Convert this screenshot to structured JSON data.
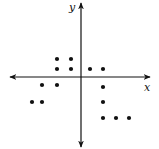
{
  "diagram": {
    "type": "scatter",
    "axes": {
      "x_label": "x",
      "y_label": "y",
      "origin_px": [
        81,
        77
      ],
      "x_axis_px": [
        10,
        150
      ],
      "y_axis_px": [
        3,
        147
      ]
    },
    "colors": {
      "axis": "#111111",
      "point": "#111111",
      "background": "#ffffff"
    },
    "points_px": [
      [
        57,
        59
      ],
      [
        71,
        59
      ],
      [
        57,
        69
      ],
      [
        71,
        69
      ],
      [
        90,
        69
      ],
      [
        103,
        69
      ],
      [
        42,
        85
      ],
      [
        57,
        85
      ],
      [
        103,
        87
      ],
      [
        32,
        102
      ],
      [
        42,
        102
      ],
      [
        103,
        102
      ],
      [
        103,
        118
      ],
      [
        116,
        118
      ],
      [
        129,
        118
      ]
    ]
  },
  "chart_data": {
    "type": "scatter",
    "title": "",
    "xlabel": "x",
    "ylabel": "y",
    "grid": false,
    "legend": null,
    "tick_labels": false,
    "series": [
      {
        "name": "points",
        "points_approx_units": [
          [
            -2,
            1.5
          ],
          [
            -1,
            1.5
          ],
          [
            -2,
            0.75
          ],
          [
            -1,
            0.75
          ],
          [
            0.7,
            0.75
          ],
          [
            1.6,
            0.75
          ],
          [
            -3,
            -0.6
          ],
          [
            -2,
            -0.6
          ],
          [
            1.6,
            -0.8
          ],
          [
            -3.5,
            -2
          ],
          [
            -3,
            -2
          ],
          [
            1.6,
            -2
          ],
          [
            1.6,
            -3
          ],
          [
            2.5,
            -3
          ],
          [
            3.4,
            -3
          ]
        ]
      }
    ]
  }
}
